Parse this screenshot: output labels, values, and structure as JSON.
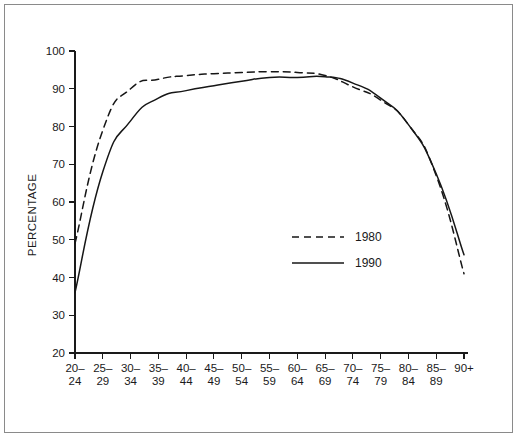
{
  "chart_data": {
    "type": "line",
    "title": "",
    "subtitle": "",
    "xlabel": "",
    "ylabel": "PERCENTAGE",
    "ylim": [
      20,
      100
    ],
    "ytick_step": 10,
    "yticks": [
      20,
      30,
      40,
      50,
      60,
      70,
      80,
      90,
      100
    ],
    "grid": false,
    "legend_position": "center-right",
    "categories": [
      "20-24",
      "25-29",
      "30-34",
      "35-39",
      "40-44",
      "45-49",
      "50-54",
      "55-59",
      "60-64",
      "65-69",
      "70-74",
      "75-79",
      "80-84",
      "85-89",
      "90+"
    ],
    "category_lines": [
      [
        "20–",
        "24"
      ],
      [
        "25–",
        "29"
      ],
      [
        "30–",
        "34"
      ],
      [
        "35–",
        "39"
      ],
      [
        "40–",
        "44"
      ],
      [
        "45–",
        "49"
      ],
      [
        "50–",
        "54"
      ],
      [
        "55–",
        "59"
      ],
      [
        "60–",
        "64"
      ],
      [
        "65–",
        "69"
      ],
      [
        "70–",
        "74"
      ],
      [
        "75–",
        "79"
      ],
      [
        "80–",
        "84"
      ],
      [
        "85–",
        "89"
      ],
      [
        "90+",
        ""
      ]
    ],
    "series": [
      {
        "name": "1980",
        "style": "dashed",
        "color": "#161616",
        "values": [
          49,
          79,
          90,
          92.5,
          93.5,
          94,
          94.3,
          94.5,
          94.3,
          93.5,
          90.5,
          87,
          80.5,
          67,
          41
        ]
      },
      {
        "name": "1990",
        "style": "solid",
        "color": "#161616",
        "values": [
          36,
          68,
          81.5,
          87.5,
          89.5,
          90.8,
          92,
          93,
          93,
          93.2,
          91.5,
          87.5,
          80.5,
          67.5,
          46
        ]
      }
    ]
  },
  "legend": {
    "entries": [
      {
        "label": "1980",
        "style": "dashed"
      },
      {
        "label": "1990",
        "style": "solid"
      }
    ]
  },
  "colors": {
    "ink": "#161616",
    "frame": "#8a8a8a",
    "background": "#ffffff"
  }
}
